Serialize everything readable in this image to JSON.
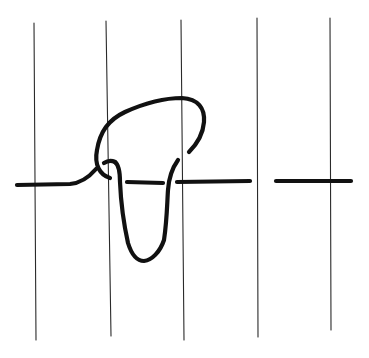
{
  "diagram": {
    "kind": "hand-drawn knot / tangle diagram",
    "vertical_line_count": 5,
    "horizontal_strand_segments": 4,
    "tangle_crossings": 4,
    "colors": {
      "background": "#ffffff",
      "strand": "#111111",
      "vertical_lines": "#2a2a2a"
    }
  }
}
